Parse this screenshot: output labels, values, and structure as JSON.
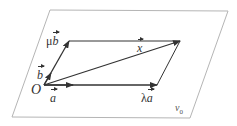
{
  "diagram": {
    "type": "vector-plane",
    "plane": {
      "label": "v",
      "label_subscript": "0",
      "corners": [
        [
          50,
          10
        ],
        [
          228,
          11
        ],
        [
          190,
          118
        ],
        [
          12,
          117
        ]
      ],
      "stroke": "#b5b5b5"
    },
    "origin": {
      "label": "O",
      "point": [
        44,
        85
      ]
    },
    "vectors": [
      {
        "id": "a",
        "label": "a",
        "from": [
          44,
          85
        ],
        "to": [
          73,
          85
        ],
        "arrow": true
      },
      {
        "id": "lambda_a",
        "label_prefix": "λ",
        "label": "a",
        "from": [
          44,
          85
        ],
        "to": [
          157,
          85
        ],
        "arrow": true
      },
      {
        "id": "b",
        "label": "b",
        "from": [
          44,
          85
        ],
        "to": [
          50,
          73
        ],
        "arrow": true
      },
      {
        "id": "mu_b",
        "label_prefix": "μ",
        "label": "b",
        "from": [
          44,
          85
        ],
        "to": [
          69,
          41
        ],
        "arrow": true
      },
      {
        "id": "x",
        "label": "x",
        "from": [
          44,
          85
        ],
        "to": [
          180,
          41
        ],
        "arrow": true
      }
    ],
    "edges": [
      {
        "from": [
          69,
          41
        ],
        "to": [
          180,
          41
        ]
      },
      {
        "from": [
          157,
          85
        ],
        "to": [
          180,
          41
        ]
      }
    ],
    "colors": {
      "vector": "#333333",
      "plane": "#b5b5b5"
    }
  },
  "labels": {
    "O": "O",
    "a": "a",
    "b": "b",
    "x": "x",
    "lambda": "λ",
    "mu": "μ",
    "plane": "v",
    "plane_sub": "0"
  }
}
